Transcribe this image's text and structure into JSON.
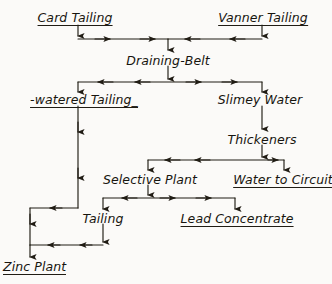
{
  "diagram": {
    "style": "hand-drawn flow diagram, black ink on aged paper",
    "colors": {
      "ink": "#201c14",
      "paper": "#fbfaf8"
    },
    "nodes": [
      {
        "id": "card-tailing",
        "label": "Card Tailing",
        "x": 75,
        "y": 18,
        "underlined": true,
        "anchor": "center"
      },
      {
        "id": "vanner-tailing",
        "label": "Vanner Tailing",
        "x": 263,
        "y": 18,
        "underlined": true,
        "anchor": "center"
      },
      {
        "id": "draining-belt",
        "label": "Draining-Belt",
        "x": 168,
        "y": 62,
        "underlined": false,
        "anchor": "center"
      },
      {
        "id": "dewatered-tailing",
        "label": "-watered Tailing_",
        "x": 84,
        "y": 101,
        "underlined": true,
        "anchor": "center"
      },
      {
        "id": "slimey-water",
        "label": "Slimey Water",
        "x": 260,
        "y": 101,
        "underlined": false,
        "anchor": "center"
      },
      {
        "id": "thickeners",
        "label": "Thickeners",
        "x": 262,
        "y": 141,
        "underlined": false,
        "anchor": "center"
      },
      {
        "id": "selective-plant",
        "label": "Selective Plant",
        "x": 150,
        "y": 181,
        "underlined": false,
        "anchor": "center"
      },
      {
        "id": "water-to-circuit",
        "label": "Water to Circuit",
        "x": 283,
        "y": 181,
        "underlined": true,
        "anchor": "center"
      },
      {
        "id": "tailing",
        "label": "Tailing",
        "x": 103,
        "y": 220,
        "underlined": false,
        "anchor": "center"
      },
      {
        "id": "lead-concentrate",
        "label": "Lead Concentrate",
        "x": 237,
        "y": 220,
        "underlined": true,
        "anchor": "center"
      },
      {
        "id": "zinc-plant",
        "label": "Zinc Plant",
        "x": 3,
        "y": 268,
        "underlined": true,
        "anchor": "left"
      }
    ],
    "flows": [
      {
        "from": "card-tailing",
        "to": "draining-belt"
      },
      {
        "from": "vanner-tailing",
        "to": "draining-belt"
      },
      {
        "from": "draining-belt",
        "to": "dewatered-tailing"
      },
      {
        "from": "draining-belt",
        "to": "slimey-water"
      },
      {
        "from": "slimey-water",
        "to": "thickeners"
      },
      {
        "from": "thickeners",
        "to": "selective-plant"
      },
      {
        "from": "thickeners",
        "to": "water-to-circuit"
      },
      {
        "from": "selective-plant",
        "to": "tailing"
      },
      {
        "from": "selective-plant",
        "to": "lead-concentrate"
      },
      {
        "from": "dewatered-tailing",
        "to": "zinc-plant"
      },
      {
        "from": "tailing",
        "to": "zinc-plant"
      }
    ]
  }
}
